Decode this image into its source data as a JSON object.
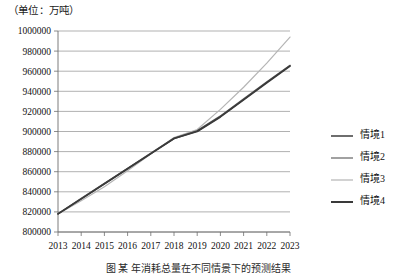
{
  "unit_label": "（单位：万吨）",
  "caption": "图    某  年消耗总量在不同情景下的预测结果",
  "legend": {
    "position": "right",
    "items": [
      {
        "label": "情境1",
        "color": "#4a4a4a"
      },
      {
        "label": "情境2",
        "color": "#8a8a8a"
      },
      {
        "label": "情境3",
        "color": "#b5b5b5"
      },
      {
        "label": "情境4",
        "color": "#3a3a3a"
      }
    ]
  },
  "chart_data": {
    "type": "line",
    "title": "",
    "xlabel": "",
    "ylabel": "",
    "unit": "万吨",
    "grid": true,
    "legend_position": "right",
    "x": [
      2013,
      2014,
      2015,
      2016,
      2017,
      2018,
      2019,
      2020,
      2021,
      2022,
      2023
    ],
    "categories": [
      "2013",
      "2014",
      "2015",
      "2016",
      "2017",
      "2018",
      "2019",
      "2020",
      "2021",
      "2022",
      "2023"
    ],
    "xlim": [
      2013,
      2023
    ],
    "ylim": [
      800000,
      1000000
    ],
    "ytick_labels": [
      "1000000",
      "980000",
      "960000",
      "940000",
      "920000",
      "900000",
      "880000",
      "860000",
      "840000",
      "820000",
      "800000"
    ],
    "ytick_values": [
      1000000,
      980000,
      960000,
      940000,
      920000,
      900000,
      880000,
      860000,
      840000,
      820000,
      800000
    ],
    "ytick_step": 20000,
    "series": [
      {
        "name": "情境1",
        "color": "#4a4a4a",
        "values": [
          818000,
          833000,
          848000,
          863000,
          878000,
          893000,
          900500,
          915000,
          932000,
          949000,
          965500
        ]
      },
      {
        "name": "情境2",
        "color": "#8a8a8a",
        "values": [
          818000,
          833500,
          848500,
          863500,
          878500,
          893500,
          901000,
          915500,
          932500,
          949500,
          966000
        ]
      },
      {
        "name": "情境3",
        "color": "#b5b5b5",
        "values": [
          818000,
          831000,
          845000,
          861000,
          877500,
          894000,
          902000,
          922000,
          944000,
          968000,
          994000
        ]
      },
      {
        "name": "情境4",
        "color": "#3a3a3a",
        "values": [
          818000,
          833000,
          848000,
          863000,
          878000,
          893000,
          900000,
          914500,
          931500,
          948500,
          965000
        ]
      }
    ]
  }
}
